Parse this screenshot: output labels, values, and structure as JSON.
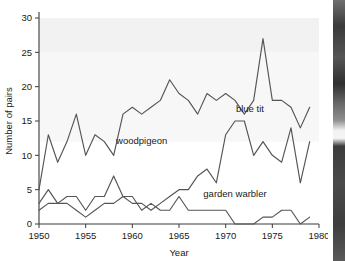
{
  "chart_data": {
    "type": "line",
    "title": "",
    "xlabel": "Year",
    "ylabel": "Number of pairs",
    "xlim": [
      1950,
      1980
    ],
    "ylim": [
      0,
      30
    ],
    "xticks": [
      1950,
      1955,
      1960,
      1965,
      1970,
      1975,
      1980
    ],
    "yticks": [
      0,
      5,
      10,
      15,
      20,
      25,
      30
    ],
    "grid": false,
    "legend_position": "inline-annotations",
    "x": [
      1950,
      1951,
      1952,
      1953,
      1954,
      1955,
      1956,
      1957,
      1958,
      1959,
      1960,
      1961,
      1962,
      1963,
      1964,
      1965,
      1966,
      1967,
      1968,
      1969,
      1970,
      1971,
      1972,
      1973,
      1974,
      1975,
      1976,
      1977,
      1978,
      1979
    ],
    "series": [
      {
        "name": "blue tit",
        "label": "blue tit",
        "color": "#555555",
        "values": [
          5,
          13,
          9,
          12,
          16,
          10,
          13,
          12,
          10,
          16,
          17,
          16,
          17,
          18,
          21,
          19,
          18,
          16,
          19,
          18,
          19,
          18,
          16,
          18,
          27,
          18,
          18,
          17,
          14,
          17
        ]
      },
      {
        "name": "woodpigeon",
        "label": "woodpigeon",
        "color": "#555555",
        "values": [
          2,
          3,
          3,
          3,
          2,
          1,
          2,
          3,
          3,
          4,
          3,
          3,
          2,
          3,
          4,
          5,
          5,
          7,
          8,
          6,
          13,
          15,
          15,
          10,
          12,
          10,
          9,
          14,
          6,
          12
        ]
      },
      {
        "name": "garden warbler",
        "label": "garden warbler",
        "color": "#555555",
        "values": [
          3,
          5,
          3,
          4,
          4,
          2,
          4,
          4,
          7,
          4,
          4,
          2,
          3,
          2,
          2,
          4,
          2,
          2,
          2,
          2,
          2,
          0,
          0,
          0,
          1,
          1,
          2,
          2,
          0,
          1
        ]
      }
    ],
    "annotations": [
      {
        "text": "blue tit",
        "x": 1972.6,
        "y": 16.3
      },
      {
        "text": "woodpigeon",
        "x": 1961.0,
        "y": 11.6
      },
      {
        "text": "garden warbler",
        "x": 1971.0,
        "y": 4.0
      }
    ]
  },
  "axis": {
    "y_title": "Number of pairs",
    "x_title": "Year",
    "ytick_labels": [
      "0",
      "5",
      "10",
      "15",
      "20",
      "25",
      "30"
    ],
    "xtick_labels": [
      "1950",
      "1955",
      "1960",
      "1965",
      "1970",
      "1975",
      "1980"
    ]
  }
}
